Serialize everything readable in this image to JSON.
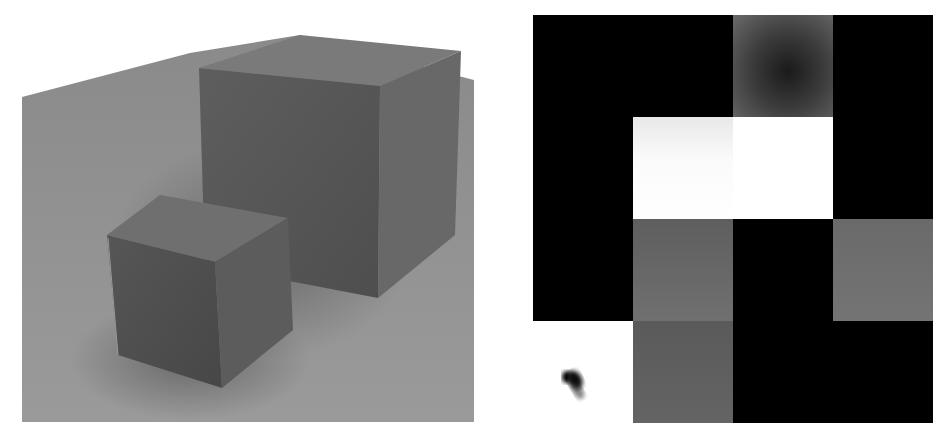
{
  "scene": {
    "description": "Rendered 3D scene of two gray cubes on a gray ground plane",
    "colors": {
      "plane": "#8c8c8c",
      "plane_shadow": "#6e6e6e",
      "large_cube_front": "#5a5a5a",
      "large_cube_side": "#666666",
      "large_cube_top": "#7a7a7a",
      "small_cube_front": "#505050",
      "small_cube_side": "#5e5e5e",
      "small_cube_top": "#6f6f6f"
    }
  },
  "grid": {
    "description": "4x4 grid of grayscale tiles",
    "rows": 4,
    "cols": 4,
    "tiles": [
      [
        "#000000",
        "#000000",
        "gradient-dark",
        "#000000"
      ],
      [
        "#000000",
        "#f4f4f4",
        "#ffffff",
        "#000000"
      ],
      [
        "#000000",
        "#6a6a6a",
        "#000000",
        "#6e6e6e"
      ],
      [
        "#ffffff",
        "#5e5e5e",
        "#000000",
        "#000000"
      ]
    ]
  }
}
